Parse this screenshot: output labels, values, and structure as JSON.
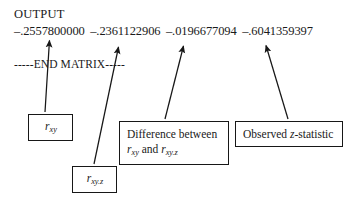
{
  "document": {
    "output_label": "OUTPUT",
    "matrix_values": [
      "–.2557800000",
      "–.2361122906",
      "–.0196677094",
      "–.6041359397"
    ],
    "end_matrix_line": "-----END MATRIX-----"
  },
  "callouts": [
    {
      "id": "r-xy",
      "label_base": "r",
      "label_subscript": "xy",
      "describes_value": "–.2557800000"
    },
    {
      "id": "r-xy-z",
      "label_base": "r",
      "label_subscript": "xy.z",
      "describes_value": "–.2361122906"
    },
    {
      "id": "difference",
      "line1": "Difference between",
      "line2_base": "r",
      "line2_sub1": "xy",
      "line2_mid": " and ",
      "line2_base2": "r",
      "line2_sub2": "xy.z",
      "describes_value": "–.0196677094"
    },
    {
      "id": "observed-z",
      "prefix": "Observed ",
      "italic_symbol": "z",
      "suffix": "-statistic",
      "describes_value": "–.6041359397"
    }
  ],
  "style": {
    "ink": "#171717",
    "paper": "#ffffff"
  }
}
